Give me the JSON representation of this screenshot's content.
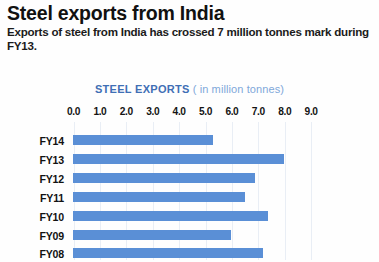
{
  "headline": "Steel exports from India",
  "subhead": "Exports of steel from India has crossed 7 million tonnes mark during FY13.",
  "chart_title_strong": "STEEL EXPORTS",
  "chart_title_light": "( in million tonnes)",
  "colors": {
    "bar": "#5a8fd6",
    "title_strong": "#3f6fb5",
    "title_light": "#7fa8da",
    "gridline": "#e9eef5",
    "text": "#111111",
    "background": "#ffffff"
  },
  "chart_data": {
    "type": "bar",
    "orientation": "horizontal",
    "xlabel": "",
    "ylabel": "",
    "xlim": [
      0.0,
      9.0
    ],
    "grid": true,
    "legend": "none",
    "tick_labels": [
      "0.0",
      "1.0",
      "2.0",
      "3.0",
      "4.0",
      "5.0",
      "6.0",
      "7.0",
      "8.0",
      "9.0"
    ],
    "ticks": [
      0.0,
      1.0,
      2.0,
      3.0,
      4.0,
      5.0,
      6.0,
      7.0,
      8.0,
      9.0
    ],
    "categories": [
      "FY14",
      "FY13",
      "FY12",
      "FY11",
      "FY10",
      "FY09",
      "FY08"
    ],
    "values": [
      5.3,
      8.0,
      6.9,
      6.5,
      7.4,
      6.0,
      7.2
    ],
    "series": [
      {
        "name": "Steel exports",
        "unit": "million tonnes",
        "values": [
          5.3,
          8.0,
          6.9,
          6.5,
          7.4,
          6.0,
          7.2
        ]
      }
    ]
  }
}
